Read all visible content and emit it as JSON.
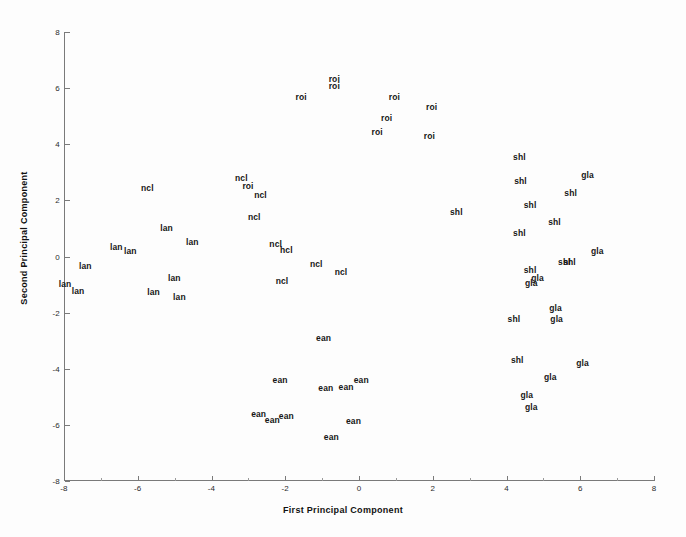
{
  "chart_data": {
    "type": "scatter",
    "title": "",
    "xlabel": "First Principal Component",
    "ylabel": "Second Principal Component",
    "xlim": [
      -8,
      8
    ],
    "ylim": [
      -8,
      8
    ],
    "xticks": [
      -8,
      -6,
      -4,
      -2,
      0,
      2,
      4,
      6,
      8
    ],
    "yticks": [
      -8,
      -6,
      -4,
      -2,
      0,
      2,
      4,
      6,
      8
    ],
    "xticklabels": [
      "-8",
      "-6",
      "-4",
      "-2",
      "0",
      "2",
      "4",
      "6",
      "8"
    ],
    "yticklabels": [
      "-8",
      "-6",
      "-4",
      "-2",
      "0",
      "2",
      "4",
      "6",
      "8"
    ],
    "grid": false,
    "legend": false,
    "marker_style": "text-label",
    "groups": [
      "roi",
      "ncl",
      "lan",
      "ean",
      "shl",
      "gla",
      "hcl"
    ],
    "points": [
      {
        "label": "roi",
        "x": -0.67,
        "y": 6.33
      },
      {
        "label": "roi",
        "x": -0.67,
        "y": 6.07
      },
      {
        "label": "roi",
        "x": -1.57,
        "y": 5.67
      },
      {
        "label": "roi",
        "x": 0.96,
        "y": 5.67
      },
      {
        "label": "roi",
        "x": 1.97,
        "y": 5.31
      },
      {
        "label": "roi",
        "x": 0.75,
        "y": 4.95
      },
      {
        "label": "roi",
        "x": 0.49,
        "y": 4.44
      },
      {
        "label": "roi",
        "x": 1.91,
        "y": 4.29
      },
      {
        "label": "roi",
        "x": -3.01,
        "y": 2.51
      },
      {
        "label": "ncl",
        "x": -5.74,
        "y": 2.44
      },
      {
        "label": "ncl",
        "x": -3.19,
        "y": 2.8
      },
      {
        "label": "ncl",
        "x": -2.67,
        "y": 2.18
      },
      {
        "label": "ncl",
        "x": -2.84,
        "y": 1.42
      },
      {
        "label": "ncl",
        "x": -2.26,
        "y": 0.44
      },
      {
        "label": "hcl",
        "x": -1.97,
        "y": 0.22
      },
      {
        "label": "ncl",
        "x": -1.16,
        "y": -0.25
      },
      {
        "label": "ncl",
        "x": -0.49,
        "y": -0.55
      },
      {
        "label": "ncl",
        "x": -2.09,
        "y": -0.87
      },
      {
        "label": "lan",
        "x": -5.22,
        "y": 1.02
      },
      {
        "label": "lan",
        "x": -4.52,
        "y": 0.51
      },
      {
        "label": "lan",
        "x": -6.58,
        "y": 0.33
      },
      {
        "label": "lan",
        "x": -6.2,
        "y": 0.18
      },
      {
        "label": "lan",
        "x": -7.42,
        "y": -0.33
      },
      {
        "label": "lan",
        "x": -5.01,
        "y": -0.76
      },
      {
        "label": "lan",
        "x": -7.97,
        "y": -0.98
      },
      {
        "label": "lan",
        "x": -7.62,
        "y": -1.24
      },
      {
        "label": "lan",
        "x": -5.57,
        "y": -1.27
      },
      {
        "label": "lan",
        "x": -4.87,
        "y": -1.45
      },
      {
        "label": "ean",
        "x": -0.96,
        "y": -2.91
      },
      {
        "label": "ean",
        "x": -2.14,
        "y": -4.4
      },
      {
        "label": "ean",
        "x": -0.9,
        "y": -4.69
      },
      {
        "label": "ean",
        "x": -0.35,
        "y": -4.65
      },
      {
        "label": "ean",
        "x": 0.06,
        "y": -4.4
      },
      {
        "label": "ean",
        "x": -2.72,
        "y": -5.6
      },
      {
        "label": "ean",
        "x": -1.97,
        "y": -5.67
      },
      {
        "label": "ean",
        "x": -2.35,
        "y": -5.82
      },
      {
        "label": "ean",
        "x": -0.15,
        "y": -5.85
      },
      {
        "label": "ean",
        "x": -0.75,
        "y": -6.44
      },
      {
        "label": "shl",
        "x": 4.35,
        "y": 3.56
      },
      {
        "label": "gla",
        "x": 6.2,
        "y": 2.91
      },
      {
        "label": "shl",
        "x": 4.38,
        "y": 2.69
      },
      {
        "label": "shl",
        "x": 5.74,
        "y": 2.25
      },
      {
        "label": "shl",
        "x": 4.64,
        "y": 1.85
      },
      {
        "label": "shl",
        "x": 2.64,
        "y": 1.6
      },
      {
        "label": "shl",
        "x": 5.3,
        "y": 1.24
      },
      {
        "label": "shl",
        "x": 4.35,
        "y": 0.84
      },
      {
        "label": "gla",
        "x": 6.46,
        "y": 0.18
      },
      {
        "label": "shl",
        "x": 5.57,
        "y": -0.18
      },
      {
        "label": "shl",
        "x": 5.71,
        "y": -0.18
      },
      {
        "label": "shl",
        "x": 4.64,
        "y": -0.47
      },
      {
        "label": "gla",
        "x": 4.84,
        "y": -0.76
      },
      {
        "label": "gla",
        "x": 4.67,
        "y": -0.95
      },
      {
        "label": "gla",
        "x": 5.33,
        "y": -1.82
      },
      {
        "label": "shl",
        "x": 4.2,
        "y": -2.22
      },
      {
        "label": "gla",
        "x": 5.36,
        "y": -2.22
      },
      {
        "label": "shl",
        "x": 4.29,
        "y": -3.68
      },
      {
        "label": "gla",
        "x": 6.06,
        "y": -3.8
      },
      {
        "label": "gla",
        "x": 5.19,
        "y": -4.29
      },
      {
        "label": "gla",
        "x": 4.55,
        "y": -4.95
      },
      {
        "label": "gla",
        "x": 4.67,
        "y": -5.35
      }
    ]
  },
  "axes": {
    "x_title": "First Principal Component",
    "y_title": "Second Principal Component"
  }
}
